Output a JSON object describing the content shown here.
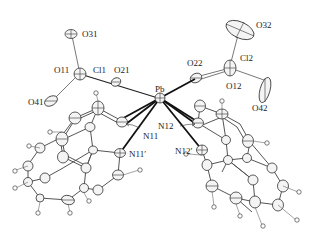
{
  "figure": {
    "type": "ORTEP molecular structure",
    "central_atom": "Pb",
    "labels": {
      "O31": "O31",
      "O11": "O11",
      "Cl1": "Cl1",
      "O21": "O21",
      "O41": "O41",
      "Pb": "Pb",
      "O32": "O32",
      "O22": "O22",
      "Cl2": "Cl2",
      "O12": "O12",
      "O42": "O42",
      "N11": "N11",
      "N12": "N12",
      "N11p": "N11′",
      "N12p": "N12′"
    }
  }
}
